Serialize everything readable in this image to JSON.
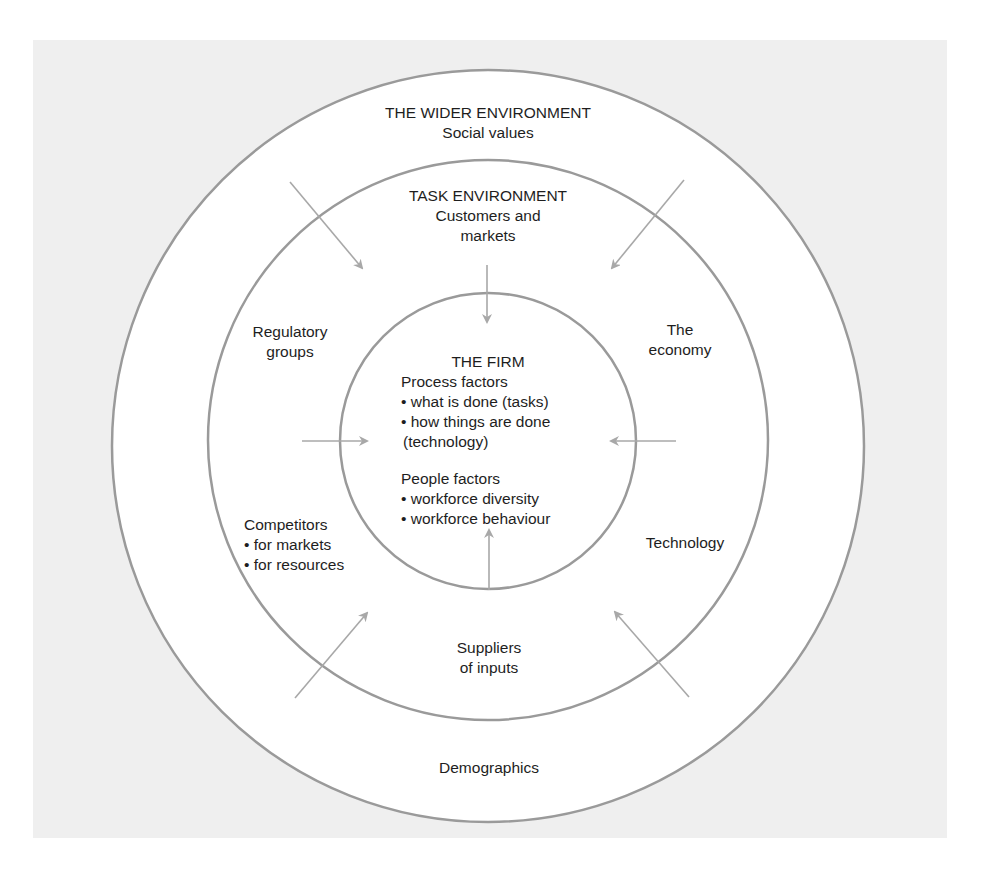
{
  "diagram": {
    "title_fragment": "",
    "colors": {
      "panel_bg": "#efefef",
      "circle_fill": "#ffffff",
      "circle_stroke": "#9a9a9a",
      "arrow": "#a8a8a8",
      "text": "#1e1e1e"
    },
    "layers": {
      "wider_environment": {
        "title": "THE WIDER ENVIRONMENT",
        "subtitle": "Social values",
        "factors": [
          "Demographics"
        ]
      },
      "task_environment": {
        "title": "TASK ENVIRONMENT",
        "subtitle_line1": "Customers and",
        "subtitle_line2": "markets",
        "factors": {
          "regulatory": [
            "Regulatory",
            "groups"
          ],
          "economy": [
            "The",
            "economy"
          ],
          "competitors": {
            "title": "Competitors",
            "bullets": [
              "• for markets",
              "• for resources"
            ]
          },
          "technology": "Technology",
          "suppliers": [
            "Suppliers",
            "of inputs"
          ]
        }
      },
      "firm": {
        "title": "THE FIRM",
        "process_factors": {
          "heading": "Process factors",
          "bullets": [
            "• what is done (tasks)",
            "• how things are done",
            "(technology)"
          ]
        },
        "people_factors": {
          "heading": "People factors",
          "bullets": [
            "• workforce diversity",
            "• workforce behaviour"
          ]
        }
      }
    },
    "arrows": [
      {
        "name": "arrow-top",
        "from": [
          487,
          265
        ],
        "to": [
          487,
          322
        ]
      },
      {
        "name": "arrow-bottom",
        "from": [
          489,
          590
        ],
        "to": [
          489,
          530
        ]
      },
      {
        "name": "arrow-left",
        "from": [
          302,
          441
        ],
        "to": [
          367,
          441
        ]
      },
      {
        "name": "arrow-right",
        "from": [
          676,
          441
        ],
        "to": [
          611,
          441
        ]
      },
      {
        "name": "arrow-top-left",
        "from": [
          290,
          182
        ],
        "to": [
          362,
          268
        ]
      },
      {
        "name": "arrow-top-right",
        "from": [
          684,
          180
        ],
        "to": [
          612,
          268
        ]
      },
      {
        "name": "arrow-bottom-left",
        "from": [
          295,
          698
        ],
        "to": [
          367,
          613
        ]
      },
      {
        "name": "arrow-bottom-right",
        "from": [
          689,
          697
        ],
        "to": [
          615,
          612
        ]
      }
    ]
  }
}
